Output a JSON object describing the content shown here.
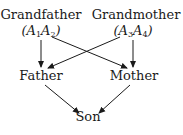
{
  "diagram": {
    "type": "inheritance-pedigree",
    "nodes": [
      {
        "id": "grandfather",
        "label": "Grandfather",
        "genotype": {
          "a": "A",
          "i1": "1",
          "b": "A",
          "i2": "2"
        }
      },
      {
        "id": "grandmother",
        "label": "Grandmother",
        "genotype": {
          "a": "A",
          "i1": "3",
          "b": "A",
          "i2": "4"
        }
      },
      {
        "id": "father",
        "label": "Father"
      },
      {
        "id": "mother",
        "label": "Mother"
      },
      {
        "id": "son",
        "label": "Son"
      }
    ],
    "edges": [
      {
        "from": "grandfather",
        "to": "father"
      },
      {
        "from": "grandfather",
        "to": "mother"
      },
      {
        "from": "grandmother",
        "to": "father"
      },
      {
        "from": "grandmother",
        "to": "mother"
      },
      {
        "from": "father",
        "to": "son"
      },
      {
        "from": "mother",
        "to": "son"
      }
    ],
    "colors": {
      "ink": "#1a1a1a",
      "background": "#ffffff"
    }
  }
}
